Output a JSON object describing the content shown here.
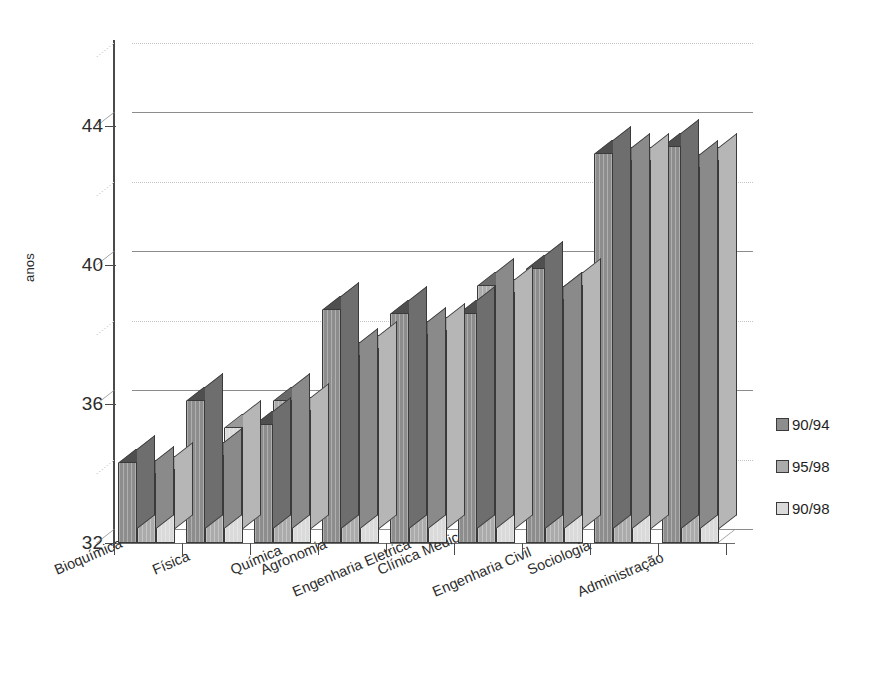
{
  "chart_data": {
    "type": "bar",
    "title": "",
    "subtitle": "",
    "xlabel": "",
    "ylabel": "anos",
    "ylim": [
      32,
      46
    ],
    "yticks": [
      32,
      36,
      40,
      44
    ],
    "ytick_labels": [
      "32",
      "36",
      "40",
      "44"
    ],
    "grid": "horizontal solid at 36/40/44 plus dotted minor lines at 34/38/42/46",
    "legend_position": "right",
    "style": "3D clustered column chart, grayscale",
    "categories": [
      "Bioquímica",
      "Física",
      "Química",
      "Agronomia",
      "Engenharia Eletrica",
      "Clínica Médica",
      "Engenharia Civil",
      "Sociologia",
      "Administração"
    ],
    "series": [
      {
        "name": "90/94",
        "color": "#8d8d8d",
        "values": [
          34.3,
          36.1,
          35.4,
          38.7,
          38.6,
          38.6,
          39.9,
          43.2,
          43.4
        ]
      },
      {
        "name": "95/98",
        "color": "#ababab",
        "values": [
          34.0,
          34.5,
          36.1,
          37.4,
          38.0,
          39.4,
          39.0,
          43.0,
          42.8
        ]
      },
      {
        "name": "90/98",
        "color": "#dadada",
        "values": [
          34.1,
          35.3,
          35.8,
          37.6,
          38.1,
          39.2,
          39.4,
          43.0,
          43.0
        ]
      }
    ]
  },
  "axis": {
    "y_label": "anos",
    "y_tick_labels": [
      "44",
      "40",
      "36",
      "32"
    ]
  },
  "legend": {
    "items": [
      {
        "label": "90/94"
      },
      {
        "label": "95/98"
      },
      {
        "label": "90/98"
      }
    ]
  }
}
